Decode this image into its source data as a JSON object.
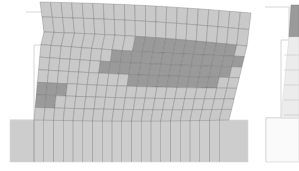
{
  "figure": {
    "type": "fem-deformed-mesh",
    "width": 299,
    "height": 171,
    "colors": {
      "background": "#ffffff",
      "element_fill": "#c9c9c9",
      "damaged_fill": "#9a9a9a",
      "mesh_line": "#6f6f6f",
      "foundation_fill": "#cdcdcd",
      "undeformed_outline": "#d6d6d6"
    },
    "panels": [
      {
        "id": "left-panel",
        "undeformed_outline": [
          [
            26,
            12
          ],
          [
            44,
            12
          ],
          [
            44,
            45
          ],
          [
            34,
            45
          ],
          [
            34,
            120
          ],
          [
            10,
            120
          ]
        ],
        "foundation": {
          "x": 10,
          "y": 120,
          "w": 238,
          "h": 42,
          "columns": 20
        },
        "wall": {
          "top_left": [
            40,
            2
          ],
          "top_right": [
            251,
            13
          ],
          "slab_bottom_left": [
            44,
            32
          ],
          "slab_bottom_right": [
            247,
            46
          ],
          "bottom_left": [
            34,
            120
          ],
          "bottom_right": [
            229,
            120
          ],
          "columns": 20,
          "slab_rows": 2,
          "body_rows": 7
        },
        "damaged_cells": [
          [
            0,
            9
          ],
          [
            0,
            10
          ],
          [
            0,
            11
          ],
          [
            0,
            12
          ],
          [
            0,
            13
          ],
          [
            0,
            14
          ],
          [
            0,
            15
          ],
          [
            0,
            16
          ],
          [
            0,
            17
          ],
          [
            0,
            18
          ],
          [
            1,
            7
          ],
          [
            1,
            8
          ],
          [
            1,
            9
          ],
          [
            1,
            10
          ],
          [
            1,
            11
          ],
          [
            1,
            12
          ],
          [
            1,
            13
          ],
          [
            1,
            14
          ],
          [
            1,
            15
          ],
          [
            1,
            16
          ],
          [
            1,
            17
          ],
          [
            1,
            18
          ],
          [
            1,
            19
          ],
          [
            2,
            6
          ],
          [
            2,
            7
          ],
          [
            2,
            8
          ],
          [
            2,
            9
          ],
          [
            2,
            10
          ],
          [
            2,
            11
          ],
          [
            2,
            12
          ],
          [
            2,
            13
          ],
          [
            2,
            14
          ],
          [
            2,
            15
          ],
          [
            2,
            16
          ],
          [
            2,
            17
          ],
          [
            2,
            18
          ],
          [
            3,
            9
          ],
          [
            3,
            10
          ],
          [
            3,
            11
          ],
          [
            3,
            12
          ],
          [
            3,
            13
          ],
          [
            3,
            14
          ],
          [
            3,
            15
          ],
          [
            3,
            16
          ],
          [
            3,
            17
          ],
          [
            4,
            0
          ],
          [
            4,
            1
          ],
          [
            4,
            2
          ],
          [
            5,
            0
          ],
          [
            5,
            1
          ]
        ]
      },
      {
        "id": "right-panel-partial",
        "undeformed_outline": [
          [
            265,
            7
          ],
          [
            289,
            7
          ],
          [
            289,
            40
          ],
          [
            281,
            40
          ],
          [
            281,
            118
          ],
          [
            266,
            118
          ],
          [
            266,
            162
          ]
        ],
        "damaged_strip": [
          [
            291,
            5
          ],
          [
            299,
            5
          ],
          [
            299,
            37
          ],
          [
            289,
            37
          ]
        ],
        "foundation_outline": {
          "x": 266,
          "y": 118,
          "w": 33,
          "h": 44
        }
      }
    ]
  }
}
